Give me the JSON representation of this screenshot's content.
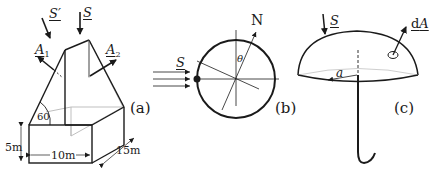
{
  "panels": {
    "a": {
      "label": "(a)",
      "vectors": {
        "S_prime": "S′",
        "S": "S",
        "A1": "A",
        "A1_sub": "1",
        "A2": "A",
        "A2_sub": "2"
      },
      "angle": "60",
      "dimensions": {
        "height": "5m",
        "width": "10m",
        "depth": "15m"
      }
    },
    "b": {
      "label": "(b)",
      "vectors": {
        "S": "S",
        "N": "N"
      },
      "angle": "θ"
    },
    "c": {
      "label": "(c)",
      "vectors": {
        "S": "S",
        "dA_prefix": "d",
        "dA": "A"
      },
      "radius": "a"
    }
  },
  "colors": {
    "stroke": "#1a1a1a",
    "faint": "#b0b0b0",
    "background": "#ffffff"
  }
}
